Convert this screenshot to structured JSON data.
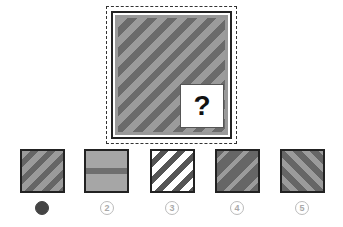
{
  "puzzle": {
    "question_mark": "?",
    "main_pattern": "diagonal-stripes-gray",
    "colors": {
      "light_stripe": "#9b9b9b",
      "dark_stripe": "#6b6b6b",
      "border": "#222222"
    }
  },
  "options": [
    {
      "label": "1",
      "pattern": "diagonal-stripes-gray",
      "selected": true
    },
    {
      "label": "2",
      "pattern": "horizontal-band",
      "selected": false
    },
    {
      "label": "3",
      "pattern": "diagonal-stripes-white-dark",
      "selected": false
    },
    {
      "label": "4",
      "pattern": "dark-with-thin-diagonal-stripes",
      "selected": false
    },
    {
      "label": "5",
      "pattern": "reverse-diagonal-stripes",
      "selected": false
    }
  ]
}
